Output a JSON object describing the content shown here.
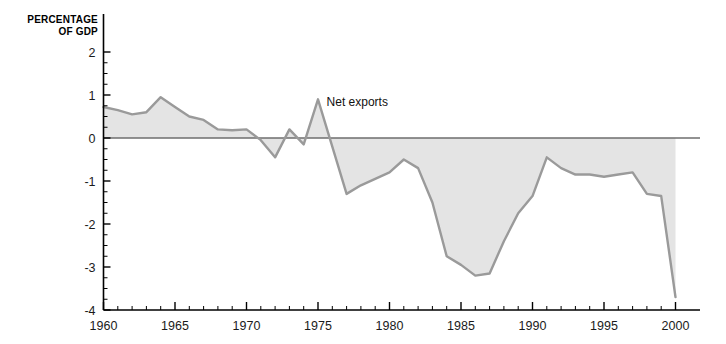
{
  "figure": {
    "axis_title": "PERCENTAGE\nOF GDP",
    "axis_title_line1": "PERCENTAGE",
    "axis_title_line2": "OF GDP",
    "background_color": "#ffffff",
    "axis_color": "#000000",
    "line_color": "#9a9a9a",
    "fill_color": "#e4e4e4",
    "zero_line_color": "#6e6e6e"
  },
  "chart_data": {
    "type": "area",
    "title": "",
    "subtitle": "",
    "xlabel": "",
    "ylabel": "PERCENTAGE OF GDP",
    "xlim": [
      1960,
      2000
    ],
    "ylim": [
      -4,
      2
    ],
    "grid": false,
    "legend_position": "inline-annotation",
    "x_major_ticks": [
      1960,
      1965,
      1970,
      1975,
      1980,
      1985,
      1990,
      1995,
      2000
    ],
    "x_major_tick_labels": [
      "1960",
      "1965",
      "1970",
      "1975",
      "1980",
      "1985",
      "1990",
      "1995",
      "2000"
    ],
    "x_minor_tick_interval": 1,
    "y_major_ticks": [
      2,
      1,
      0,
      -1,
      -2,
      -3,
      -4
    ],
    "y_major_tick_labels": [
      "2",
      "1",
      "0",
      "-1",
      "-2",
      "-3",
      "-4"
    ],
    "y_minor_tick_interval": 0.25,
    "annotations": [
      {
        "text": "Net exports",
        "x": 1975.6,
        "y": 0.75
      }
    ],
    "series": [
      {
        "name": "Net exports",
        "fill_to": 0,
        "x": [
          1960,
          1961,
          1962,
          1963,
          1964,
          1965,
          1966,
          1967,
          1968,
          1969,
          1970,
          1971,
          1972,
          1973,
          1974,
          1975,
          1976,
          1977,
          1978,
          1979,
          1980,
          1981,
          1982,
          1983,
          1984,
          1985,
          1986,
          1987,
          1988,
          1989,
          1990,
          1991,
          1992,
          1993,
          1994,
          1995,
          1996,
          1997,
          1998,
          1999,
          2000
        ],
        "values": [
          0.72,
          0.65,
          0.55,
          0.6,
          0.95,
          0.72,
          0.5,
          0.42,
          0.2,
          0.18,
          0.2,
          -0.05,
          -0.45,
          0.2,
          -0.15,
          0.9,
          -0.2,
          -1.3,
          -1.1,
          -0.95,
          -0.8,
          -0.5,
          -0.7,
          -1.5,
          -2.75,
          -2.95,
          -3.2,
          -3.15,
          -2.4,
          -1.75,
          -1.35,
          -0.45,
          -0.7,
          -0.85,
          -0.85,
          -0.9,
          -0.85,
          -0.8,
          -1.3,
          -1.35,
          -3.7
        ]
      }
    ]
  }
}
